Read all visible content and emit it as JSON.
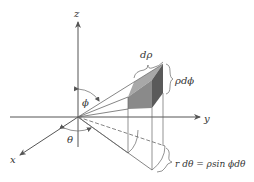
{
  "figure": {
    "axes": {
      "x_label": "x",
      "y_label": "y",
      "z_label": "z"
    },
    "angles": {
      "phi_label": "ϕ",
      "theta_label": "θ"
    },
    "element": {
      "d_rho_label": "dρ",
      "rho_d_phi_label": "ρdϕ",
      "r_d_theta_label": "r dθ = ρsin ϕdθ"
    },
    "colors": {
      "line": "#555555",
      "box_front": "#8a8a8a",
      "box_side": "#5a5a5a",
      "box_top": "#a8a8a8",
      "background": "#ffffff"
    }
  }
}
